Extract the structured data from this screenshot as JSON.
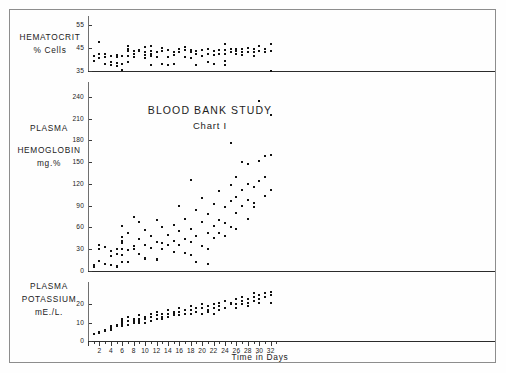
{
  "title": "BLOOD BANK STUDY",
  "subtitle": "Chart I",
  "xaxis_title": "Time in Days",
  "panels": {
    "hematocrit": {
      "label_line1": "HEMATOCRIT",
      "label_line2": "% Cells"
    },
    "hemoglobin": {
      "label_line1": "PLASMA",
      "label_line2": "HEMOGLOBIN",
      "label_line3": "mg.%"
    },
    "potassium": {
      "label_line1": "PLASMA",
      "label_line2": "POTASSIUM",
      "label_line3": "mE./L."
    }
  },
  "chart_data": [
    {
      "type": "scatter",
      "title": "Hematocrit",
      "ylabel": "HEMATOCRIT % Cells",
      "xlabel": "Time in Days",
      "ylim": [
        35,
        57
      ],
      "xlim": [
        0,
        33
      ],
      "yticks": [
        35,
        45,
        55
      ],
      "grid": false,
      "points": [
        [
          1,
          41.5
        ],
        [
          1,
          39.5
        ],
        [
          2,
          47.5
        ],
        [
          2,
          42.5
        ],
        [
          2,
          40.5
        ],
        [
          3,
          42.5
        ],
        [
          3,
          41
        ],
        [
          3,
          38
        ],
        [
          4,
          41.5
        ],
        [
          4,
          39
        ],
        [
          4,
          37.5
        ],
        [
          5,
          42
        ],
        [
          5,
          41
        ],
        [
          5,
          38.5
        ],
        [
          5,
          37
        ],
        [
          6,
          41.5
        ],
        [
          6,
          38
        ],
        [
          6,
          35.5
        ],
        [
          7,
          46
        ],
        [
          7,
          44.5
        ],
        [
          7,
          43.5
        ],
        [
          7,
          41.5
        ],
        [
          7,
          39
        ],
        [
          8,
          43.5
        ],
        [
          8,
          42.5
        ],
        [
          8,
          41
        ],
        [
          9,
          44
        ],
        [
          9,
          43.5
        ],
        [
          10,
          45.5
        ],
        [
          10,
          43
        ],
        [
          10,
          42
        ],
        [
          10,
          40.5
        ],
        [
          11,
          46
        ],
        [
          11,
          43.5
        ],
        [
          11,
          42.5
        ],
        [
          11,
          41.5
        ],
        [
          11,
          37.5
        ],
        [
          12,
          43
        ],
        [
          12,
          41
        ],
        [
          13,
          45
        ],
        [
          13,
          43.5
        ],
        [
          13,
          38
        ],
        [
          14,
          44
        ],
        [
          14,
          41
        ],
        [
          14,
          37.5
        ],
        [
          15,
          43
        ],
        [
          15,
          42
        ],
        [
          15,
          38
        ],
        [
          16,
          44.5
        ],
        [
          16,
          43
        ],
        [
          17,
          45.5
        ],
        [
          17,
          44
        ],
        [
          17,
          41
        ],
        [
          18,
          44
        ],
        [
          18,
          43
        ],
        [
          18,
          40.5
        ],
        [
          19,
          43.5
        ],
        [
          19,
          42.5
        ],
        [
          19,
          37.5
        ],
        [
          20,
          44
        ],
        [
          20,
          41.5
        ],
        [
          21,
          44.5
        ],
        [
          21,
          42.5
        ],
        [
          21,
          39
        ],
        [
          22,
          43.5
        ],
        [
          22,
          42
        ],
        [
          22,
          38
        ],
        [
          23,
          44
        ],
        [
          23,
          42.5
        ],
        [
          24,
          46.5
        ],
        [
          24,
          44
        ],
        [
          24,
          42.5
        ],
        [
          24,
          39.5
        ],
        [
          24,
          37.5
        ],
        [
          25,
          44.5
        ],
        [
          25,
          43
        ],
        [
          26,
          44.5
        ],
        [
          26,
          43.5
        ],
        [
          26,
          42.5
        ],
        [
          27,
          44.5
        ],
        [
          27,
          43
        ],
        [
          27,
          42
        ],
        [
          28,
          45
        ],
        [
          28,
          43
        ],
        [
          29,
          44.5
        ],
        [
          29,
          43
        ],
        [
          29,
          41.5
        ],
        [
          30,
          46
        ],
        [
          30,
          43.5
        ],
        [
          31,
          44.5
        ],
        [
          31,
          43
        ],
        [
          32,
          46.5
        ],
        [
          32,
          43.5
        ],
        [
          32,
          35
        ]
      ]
    },
    {
      "type": "scatter",
      "title": "Plasma Hemoglobin",
      "ylabel": "PLASMA HEMOGLOBIN mg.%",
      "xlabel": "Time in Days",
      "ylim": [
        0,
        255
      ],
      "xlim": [
        0,
        33
      ],
      "yticks": [
        0,
        30,
        60,
        90,
        120,
        150,
        180,
        210,
        240
      ],
      "grid": false,
      "points": [
        [
          1,
          8
        ],
        [
          1,
          6
        ],
        [
          2,
          36
        ],
        [
          2,
          31
        ],
        [
          2,
          14
        ],
        [
          3,
          33
        ],
        [
          3,
          9
        ],
        [
          4,
          28
        ],
        [
          4,
          20
        ],
        [
          4,
          8
        ],
        [
          5,
          30
        ],
        [
          5,
          23
        ],
        [
          5,
          7
        ],
        [
          5,
          5
        ],
        [
          6,
          62
        ],
        [
          6,
          47
        ],
        [
          6,
          42
        ],
        [
          6,
          38
        ],
        [
          6,
          30
        ],
        [
          6,
          22
        ],
        [
          6,
          12
        ],
        [
          7,
          52
        ],
        [
          7,
          29
        ],
        [
          7,
          13
        ],
        [
          8,
          75
        ],
        [
          8,
          34
        ],
        [
          8,
          30
        ],
        [
          9,
          68
        ],
        [
          9,
          44
        ],
        [
          9,
          23
        ],
        [
          10,
          56
        ],
        [
          10,
          36
        ],
        [
          10,
          18
        ],
        [
          10,
          16
        ],
        [
          11,
          48
        ],
        [
          11,
          32
        ],
        [
          12,
          70
        ],
        [
          12,
          40
        ],
        [
          12,
          17
        ],
        [
          12,
          15
        ],
        [
          13,
          60
        ],
        [
          13,
          38
        ],
        [
          13,
          30
        ],
        [
          14,
          50
        ],
        [
          14,
          36
        ],
        [
          15,
          64
        ],
        [
          15,
          42
        ],
        [
          15,
          26
        ],
        [
          16,
          90
        ],
        [
          16,
          55
        ],
        [
          16,
          36
        ],
        [
          17,
          72
        ],
        [
          17,
          44
        ],
        [
          17,
          25
        ],
        [
          18,
          126
        ],
        [
          18,
          58
        ],
        [
          18,
          40
        ],
        [
          18,
          22
        ],
        [
          19,
          84
        ],
        [
          19,
          48
        ],
        [
          19,
          12
        ],
        [
          20,
          100
        ],
        [
          20,
          68
        ],
        [
          20,
          35
        ],
        [
          21,
          78
        ],
        [
          21,
          52
        ],
        [
          21,
          30
        ],
        [
          21,
          10
        ],
        [
          22,
          92
        ],
        [
          22,
          62
        ],
        [
          22,
          45
        ],
        [
          23,
          110
        ],
        [
          23,
          70
        ],
        [
          23,
          52
        ],
        [
          24,
          88
        ],
        [
          24,
          66
        ],
        [
          24,
          48
        ],
        [
          25,
          176
        ],
        [
          25,
          118
        ],
        [
          25,
          96
        ],
        [
          25,
          60
        ],
        [
          26,
          130
        ],
        [
          26,
          102
        ],
        [
          26,
          80
        ],
        [
          26,
          58
        ],
        [
          27,
          150
        ],
        [
          27,
          112
        ],
        [
          27,
          90
        ],
        [
          28,
          148
        ],
        [
          28,
          120
        ],
        [
          28,
          98
        ],
        [
          28,
          72
        ],
        [
          29,
          116
        ],
        [
          29,
          94
        ],
        [
          29,
          88
        ],
        [
          30,
          235
        ],
        [
          30,
          152
        ],
        [
          30,
          124
        ],
        [
          31,
          158
        ],
        [
          31,
          130
        ],
        [
          31,
          104
        ],
        [
          32,
          215
        ],
        [
          32,
          160
        ],
        [
          32,
          112
        ]
      ]
    },
    {
      "type": "scatter",
      "title": "Plasma Potassium",
      "ylabel": "PLASMA POTASSIUM mE./L.",
      "xlabel": "Time in Days",
      "ylim": [
        0,
        30
      ],
      "xlim": [
        0,
        33
      ],
      "yticks": [
        0,
        10,
        20
      ],
      "grid": false,
      "points": [
        [
          1,
          4
        ],
        [
          2,
          5
        ],
        [
          2,
          4.5
        ],
        [
          3,
          6
        ],
        [
          3,
          5.5
        ],
        [
          4,
          8
        ],
        [
          4,
          7
        ],
        [
          4,
          6
        ],
        [
          5,
          9
        ],
        [
          5,
          8
        ],
        [
          6,
          12
        ],
        [
          6,
          11
        ],
        [
          6,
          10
        ],
        [
          6,
          9
        ],
        [
          6,
          8
        ],
        [
          7,
          13
        ],
        [
          7,
          11
        ],
        [
          7,
          9
        ],
        [
          8,
          12
        ],
        [
          8,
          11
        ],
        [
          8,
          10
        ],
        [
          9,
          14
        ],
        [
          9,
          12
        ],
        [
          9,
          11
        ],
        [
          9,
          10
        ],
        [
          10,
          13
        ],
        [
          10,
          12
        ],
        [
          10,
          10
        ],
        [
          11,
          15
        ],
        [
          11,
          13
        ],
        [
          11,
          11
        ],
        [
          12,
          16
        ],
        [
          12,
          14
        ],
        [
          12,
          12
        ],
        [
          13,
          15
        ],
        [
          13,
          13
        ],
        [
          13,
          12
        ],
        [
          14,
          17
        ],
        [
          14,
          15
        ],
        [
          14,
          13
        ],
        [
          15,
          16
        ],
        [
          15,
          15
        ],
        [
          15,
          14
        ],
        [
          16,
          18
        ],
        [
          16,
          16
        ],
        [
          16,
          14
        ],
        [
          17,
          17
        ],
        [
          17,
          15
        ],
        [
          18,
          19
        ],
        [
          18,
          17
        ],
        [
          18,
          15
        ],
        [
          19,
          18
        ],
        [
          19,
          16
        ],
        [
          20,
          20
        ],
        [
          20,
          18
        ],
        [
          20,
          15
        ],
        [
          21,
          19
        ],
        [
          21,
          17
        ],
        [
          21,
          16
        ],
        [
          22,
          20
        ],
        [
          22,
          18
        ],
        [
          22,
          15
        ],
        [
          23,
          21
        ],
        [
          23,
          19
        ],
        [
          23,
          17
        ],
        [
          24,
          22
        ],
        [
          24,
          18
        ],
        [
          25,
          21
        ],
        [
          25,
          20
        ],
        [
          26,
          23
        ],
        [
          26,
          20
        ],
        [
          26,
          18
        ],
        [
          27,
          24
        ],
        [
          27,
          22
        ],
        [
          27,
          20
        ],
        [
          28,
          23
        ],
        [
          28,
          21
        ],
        [
          28,
          19
        ],
        [
          29,
          26
        ],
        [
          29,
          24
        ],
        [
          29,
          22
        ],
        [
          30,
          25
        ],
        [
          30,
          23
        ],
        [
          30,
          21
        ],
        [
          31,
          26
        ],
        [
          31,
          24
        ],
        [
          32,
          27
        ],
        [
          32,
          25
        ],
        [
          32,
          21
        ]
      ]
    }
  ]
}
